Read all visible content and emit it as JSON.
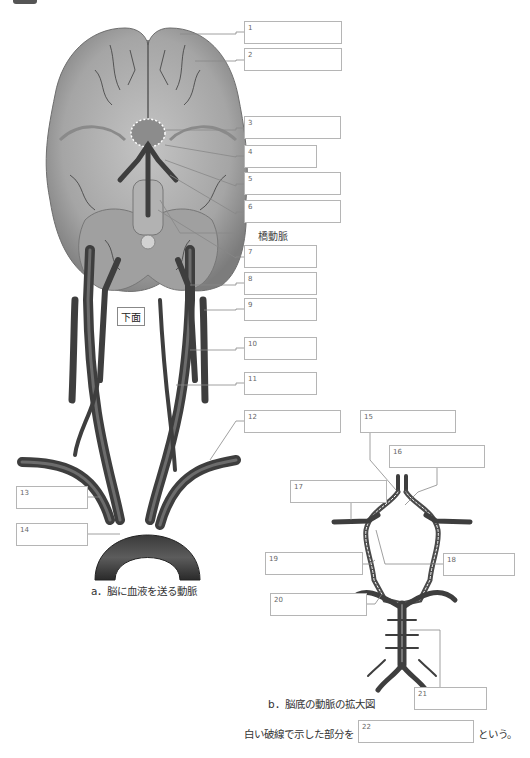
{
  "figure": {
    "view_tag": "下面",
    "caption_a": "a．脳に血液を送る動脈",
    "caption_b": "b．脳底の動脈の拡大図",
    "pons_artery_label": "橋動脈",
    "question": {
      "prefix": "白い破線で示した部分を",
      "suffix": "という。"
    }
  },
  "label_boxes": [
    {
      "num": "1",
      "x": 244,
      "y": 21,
      "w": 98,
      "h": 23
    },
    {
      "num": "2",
      "x": 244,
      "y": 48,
      "w": 98,
      "h": 23
    },
    {
      "num": "3",
      "x": 244,
      "y": 116,
      "w": 97,
      "h": 23
    },
    {
      "num": "4",
      "x": 244,
      "y": 145,
      "w": 73,
      "h": 23
    },
    {
      "num": "5",
      "x": 244,
      "y": 172,
      "w": 97,
      "h": 23
    },
    {
      "num": "6",
      "x": 244,
      "y": 200,
      "w": 97,
      "h": 23
    },
    {
      "num": "7",
      "x": 244,
      "y": 245,
      "w": 73,
      "h": 23
    },
    {
      "num": "8",
      "x": 244,
      "y": 272,
      "w": 73,
      "h": 23
    },
    {
      "num": "9",
      "x": 244,
      "y": 298,
      "w": 73,
      "h": 23
    },
    {
      "num": "10",
      "x": 244,
      "y": 337,
      "w": 73,
      "h": 23
    },
    {
      "num": "11",
      "x": 244,
      "y": 372,
      "w": 73,
      "h": 23
    },
    {
      "num": "12",
      "x": 244,
      "y": 410,
      "w": 97,
      "h": 23
    },
    {
      "num": "13",
      "x": 16,
      "y": 486,
      "w": 72,
      "h": 23
    },
    {
      "num": "14",
      "x": 16,
      "y": 523,
      "w": 72,
      "h": 23
    },
    {
      "num": "15",
      "x": 360,
      "y": 410,
      "w": 96,
      "h": 23
    },
    {
      "num": "16",
      "x": 389,
      "y": 445,
      "w": 96,
      "h": 23
    },
    {
      "num": "17",
      "x": 290,
      "y": 480,
      "w": 97,
      "h": 23
    },
    {
      "num": "18",
      "x": 443,
      "y": 553,
      "w": 72,
      "h": 23
    },
    {
      "num": "19",
      "x": 265,
      "y": 552,
      "w": 98,
      "h": 23
    },
    {
      "num": "20",
      "x": 270,
      "y": 593,
      "w": 97,
      "h": 23
    },
    {
      "num": "21",
      "x": 414,
      "y": 687,
      "w": 73,
      "h": 23
    },
    {
      "num": "22",
      "x": 358,
      "y": 720,
      "w": 116,
      "h": 23
    }
  ],
  "colors": {
    "brain_fill": "#a9a9a9",
    "brain_shadow": "#7d7d7d",
    "vessel": "#4a4a4a",
    "vessel_dark": "#2e2e2e",
    "box_border": "#b5b5b5",
    "leader_line": "#888888"
  }
}
